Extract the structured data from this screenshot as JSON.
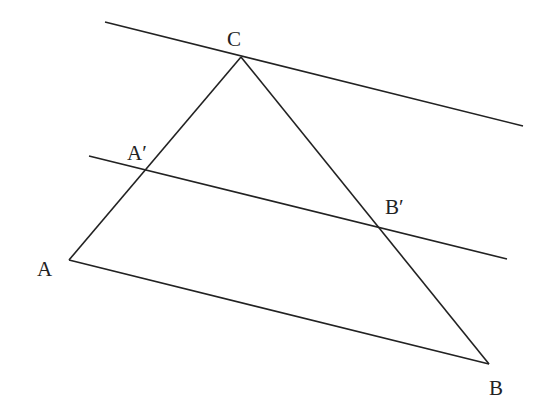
{
  "diagram": {
    "title": "",
    "stroke_color": "#222222",
    "background": "#ffffff",
    "points": {
      "A": {
        "label": "A",
        "x": 69,
        "y": 260
      },
      "B": {
        "label": "B",
        "x": 489,
        "y": 364
      },
      "C": {
        "label": "C",
        "x": 241,
        "y": 57
      },
      "A_prime": {
        "label": "A′",
        "x": 145,
        "y": 170
      },
      "B_prime": {
        "label": "B′",
        "x": 380,
        "y": 228
      }
    },
    "segments": [
      {
        "name": "AB",
        "from": "A",
        "to": "B"
      },
      {
        "name": "BC",
        "from": "B",
        "to": "C"
      },
      {
        "name": "CA",
        "from": "C",
        "to": "A"
      }
    ],
    "lines": [
      {
        "name": "line-through-C",
        "x1": 105,
        "y1": 22,
        "x2": 523,
        "y2": 126
      },
      {
        "name": "line-A'B'",
        "x1": 89,
        "y1": 156,
        "x2": 507,
        "y2": 259
      }
    ],
    "labels": [
      {
        "key": "C",
        "text": "C",
        "x": 227,
        "y": 46
      },
      {
        "key": "A_prime",
        "text": "A′",
        "x": 127,
        "y": 160
      },
      {
        "key": "B_prime",
        "text": "B′",
        "x": 385,
        "y": 214
      },
      {
        "key": "A",
        "text": "A",
        "x": 37,
        "y": 276
      },
      {
        "key": "B",
        "text": "B",
        "x": 489,
        "y": 395
      }
    ]
  }
}
